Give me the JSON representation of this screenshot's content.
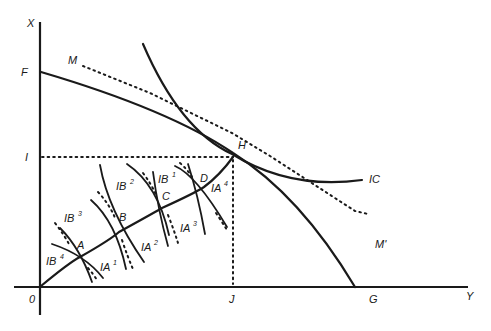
{
  "diagram": {
    "type": "edgeworth-box-offer-curve / production-possibility diagram",
    "colors": {
      "ink": "#1a1a1a",
      "background": "#ffffff"
    },
    "axes": {
      "vertical_label": "X",
      "horizontal_label": "Y",
      "origin_label": "0"
    },
    "points": {
      "F": "F",
      "M": "M",
      "M_prime": "M'",
      "H": "H",
      "I": "I",
      "IC": "IC",
      "J": "J",
      "G": "G",
      "A": "A",
      "B": "B",
      "C": "C",
      "D": "D"
    },
    "isoquants": {
      "IB4": {
        "base": "IB",
        "sup": "4"
      },
      "IB3": {
        "base": "IB",
        "sup": "3"
      },
      "IB2": {
        "base": "IB",
        "sup": "2"
      },
      "IB1": {
        "base": "IB",
        "sup": "1"
      },
      "IA1": {
        "base": "IA",
        "sup": "1"
      },
      "IA2": {
        "base": "IA",
        "sup": "2"
      },
      "IA3": {
        "base": "IA",
        "sup": "3"
      },
      "IA4": {
        "base": "IA",
        "sup": "4"
      }
    },
    "curves": [
      {
        "name": "production-possibility-frontier",
        "from": "F",
        "to": "G",
        "style": "solid"
      },
      {
        "name": "indifference-curve",
        "label": "IC",
        "style": "solid"
      },
      {
        "name": "price-line",
        "from": "M",
        "to": "M'",
        "style": "dotted"
      },
      {
        "name": "contract-curve",
        "from": "0",
        "to": "H",
        "through": [
          "A",
          "B",
          "C",
          "D"
        ],
        "style": "solid"
      },
      {
        "name": "guide-I-H",
        "style": "dotted"
      },
      {
        "name": "guide-H-J",
        "style": "dotted"
      }
    ]
  }
}
